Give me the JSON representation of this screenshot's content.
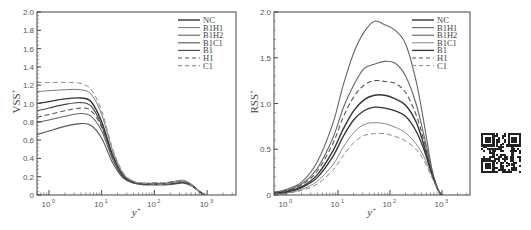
{
  "chart_data": [
    {
      "type": "line",
      "title": "",
      "xlabel": "y+",
      "ylabel": "VSS+",
      "xscale": "log",
      "x_ticks": [
        "10^0",
        "10^1",
        "10^2",
        "10^3"
      ],
      "xlim_log10": [
        -0.23,
        3.55
      ],
      "ylim": [
        0,
        2.0
      ],
      "y_ticks": [
        0,
        0.2,
        0.4,
        0.6,
        0.8,
        1.0,
        1.2,
        1.4,
        1.6,
        1.8,
        2.0
      ],
      "legend_position": "upper right",
      "grid": false,
      "x_log10": [
        -0.23,
        0.0,
        0.3,
        0.6,
        0.8,
        1.0,
        1.2,
        1.4,
        1.6,
        1.8,
        2.0,
        2.2,
        2.4,
        2.55,
        2.7,
        2.85,
        2.95
      ],
      "series": [
        {
          "name": "NC",
          "style": "solid",
          "color": "#333333",
          "width": 1.4,
          "values": [
            1.0,
            1.02,
            1.05,
            1.06,
            1.02,
            0.8,
            0.45,
            0.22,
            0.14,
            0.12,
            0.12,
            0.12,
            0.13,
            0.14,
            0.11,
            0.04,
            0.0
          ]
        },
        {
          "name": "B1H1",
          "style": "solid",
          "color": "#777777",
          "width": 1.0,
          "values": [
            1.13,
            1.14,
            1.15,
            1.15,
            1.1,
            0.88,
            0.5,
            0.24,
            0.15,
            0.13,
            0.13,
            0.13,
            0.15,
            0.16,
            0.12,
            0.04,
            0.0
          ]
        },
        {
          "name": "B1H2",
          "style": "solid",
          "color": "#666666",
          "width": 1.1,
          "values": [
            0.79,
            0.82,
            0.86,
            0.89,
            0.86,
            0.7,
            0.4,
            0.2,
            0.13,
            0.12,
            0.12,
            0.12,
            0.13,
            0.14,
            0.11,
            0.04,
            0.0
          ]
        },
        {
          "name": "B1C1",
          "style": "solid",
          "color": "#555555",
          "width": 1.1,
          "values": [
            0.66,
            0.7,
            0.75,
            0.78,
            0.76,
            0.62,
            0.36,
            0.19,
            0.13,
            0.11,
            0.11,
            0.11,
            0.12,
            0.13,
            0.1,
            0.04,
            0.0
          ]
        },
        {
          "name": "B1",
          "style": "solid",
          "color": "#444444",
          "width": 1.1,
          "values": [
            0.92,
            0.95,
            0.99,
            1.01,
            0.97,
            0.76,
            0.43,
            0.21,
            0.14,
            0.12,
            0.12,
            0.12,
            0.13,
            0.14,
            0.11,
            0.04,
            0.0
          ]
        },
        {
          "name": "H1",
          "style": "dashed",
          "color": "#555555",
          "width": 1.1,
          "values": [
            0.85,
            0.88,
            0.92,
            0.95,
            0.92,
            0.74,
            0.42,
            0.21,
            0.14,
            0.12,
            0.13,
            0.13,
            0.15,
            0.15,
            0.11,
            0.04,
            0.0
          ]
        },
        {
          "name": "C1",
          "style": "dashed",
          "color": "#999999",
          "width": 1.1,
          "values": [
            1.23,
            1.23,
            1.23,
            1.22,
            1.15,
            0.92,
            0.52,
            0.25,
            0.15,
            0.13,
            0.12,
            0.12,
            0.14,
            0.15,
            0.11,
            0.04,
            0.0
          ]
        }
      ]
    },
    {
      "type": "line",
      "title": "",
      "xlabel": "y+",
      "ylabel": "RSS+",
      "xscale": "log",
      "x_ticks": [
        "10^0",
        "10^1",
        "10^2",
        "10^3"
      ],
      "xlim_log10": [
        -0.23,
        3.54
      ],
      "ylim": [
        0,
        2.0
      ],
      "y_ticks": [
        0,
        0.5,
        1.0,
        1.5,
        2.0
      ],
      "legend_position": "upper right",
      "grid": false,
      "x_log10": [
        -0.23,
        0.0,
        0.3,
        0.6,
        0.9,
        1.1,
        1.3,
        1.5,
        1.7,
        1.9,
        2.1,
        2.3,
        2.5,
        2.65,
        2.8,
        2.92,
        3.0
      ],
      "series": [
        {
          "name": "NC",
          "style": "solid",
          "color": "#333333",
          "width": 1.4,
          "values": [
            0.02,
            0.04,
            0.09,
            0.22,
            0.48,
            0.72,
            0.92,
            1.04,
            1.09,
            1.09,
            1.05,
            0.98,
            0.8,
            0.55,
            0.25,
            0.06,
            0.0
          ]
        },
        {
          "name": "B1H1",
          "style": "solid",
          "color": "#666666",
          "width": 1.1,
          "values": [
            0.03,
            0.06,
            0.14,
            0.36,
            0.78,
            1.2,
            1.55,
            1.78,
            1.9,
            1.86,
            1.8,
            1.65,
            1.25,
            0.8,
            0.3,
            0.06,
            0.0
          ]
        },
        {
          "name": "B1H2",
          "style": "solid",
          "color": "#666666",
          "width": 1.1,
          "values": [
            0.03,
            0.05,
            0.12,
            0.29,
            0.62,
            0.95,
            1.2,
            1.38,
            1.43,
            1.46,
            1.44,
            1.3,
            1.0,
            0.66,
            0.28,
            0.06,
            0.0
          ]
        },
        {
          "name": "B1C1",
          "style": "solid",
          "color": "#888888",
          "width": 1.0,
          "values": [
            0.01,
            0.02,
            0.06,
            0.15,
            0.33,
            0.52,
            0.68,
            0.77,
            0.79,
            0.78,
            0.74,
            0.68,
            0.56,
            0.42,
            0.22,
            0.06,
            0.0
          ]
        },
        {
          "name": "B1",
          "style": "solid",
          "color": "#333333",
          "width": 1.3,
          "values": [
            0.02,
            0.03,
            0.08,
            0.19,
            0.42,
            0.64,
            0.82,
            0.92,
            0.96,
            0.95,
            0.92,
            0.86,
            0.7,
            0.5,
            0.24,
            0.06,
            0.0
          ]
        },
        {
          "name": "H1",
          "style": "dashed",
          "color": "#555555",
          "width": 1.1,
          "values": [
            0.02,
            0.04,
            0.11,
            0.26,
            0.56,
            0.85,
            1.07,
            1.2,
            1.25,
            1.24,
            1.22,
            1.12,
            0.88,
            0.6,
            0.26,
            0.06,
            0.0
          ]
        },
        {
          "name": "C1",
          "style": "dashed",
          "color": "#888888",
          "width": 1.0,
          "values": [
            0.01,
            0.02,
            0.05,
            0.12,
            0.27,
            0.43,
            0.57,
            0.65,
            0.67,
            0.67,
            0.64,
            0.59,
            0.5,
            0.38,
            0.2,
            0.06,
            0.0
          ]
        }
      ]
    }
  ],
  "panels": [
    {
      "ylabel": "VSS",
      "ylabel_sup": "+",
      "xlabel": "y",
      "xlabel_sup": "+"
    },
    {
      "ylabel": "RSS",
      "ylabel_sup": "+",
      "xlabel": "y",
      "xlabel_sup": "+"
    }
  ],
  "qr_code": {
    "label": "qr-code"
  }
}
